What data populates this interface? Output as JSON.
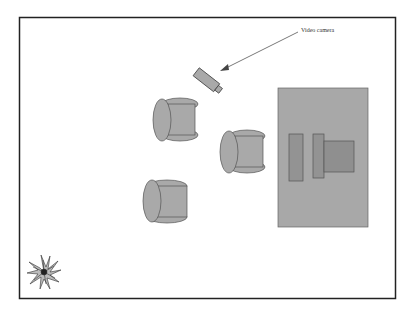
{
  "diagram": {
    "type": "room-layout",
    "annotations": [
      {
        "id": "camera-label",
        "text": "Video camera"
      }
    ],
    "objects": [
      {
        "kind": "video-camera"
      },
      {
        "kind": "chair",
        "count": 3
      },
      {
        "kind": "desk",
        "items": [
          "panel",
          "panel",
          "monitor"
        ]
      },
      {
        "kind": "plant"
      }
    ],
    "colors": {
      "fill": "#a9a9a9",
      "desk": "#a8a8a8",
      "dark_fill": "#8f8f8f",
      "stroke": "#444444",
      "border": "#222222"
    }
  }
}
